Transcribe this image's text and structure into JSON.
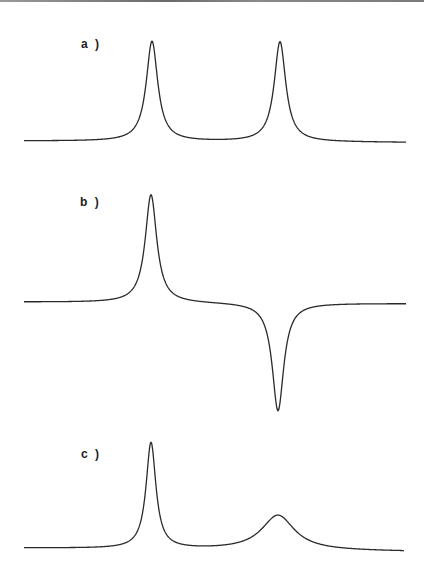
{
  "figure": {
    "panels": [
      {
        "label": "a )"
      },
      {
        "label": "b )"
      },
      {
        "label": "c )"
      }
    ]
  },
  "colors": {
    "line": "#2a2a2a",
    "background": "#ffffff"
  },
  "chart_data": [
    {
      "type": "line",
      "title": "a )",
      "description": "Two equal positive Lorentzian peaks",
      "xlabel": "",
      "ylabel": "",
      "grid": false,
      "series": [
        {
          "name": "spectrum",
          "peaks": [
            {
              "center": 152,
              "amplitude": 1.0,
              "width": 7
            },
            {
              "center": 280,
              "amplitude": 1.0,
              "width": 7
            }
          ]
        }
      ]
    },
    {
      "type": "line",
      "title": "b )",
      "description": "One positive peak and one equal negative (inverted) peak",
      "xlabel": "",
      "ylabel": "",
      "grid": false,
      "series": [
        {
          "name": "spectrum",
          "peaks": [
            {
              "center": 151,
              "amplitude": 1.0,
              "width": 7
            },
            {
              "center": 278,
              "amplitude": -1.0,
              "width": 7
            }
          ]
        }
      ]
    },
    {
      "type": "line",
      "title": "c )",
      "description": "One sharp peak and one broadened, reduced peak",
      "xlabel": "",
      "ylabel": "",
      "grid": false,
      "series": [
        {
          "name": "spectrum",
          "peaks": [
            {
              "center": 151,
              "amplitude": 1.0,
              "width": 6
            },
            {
              "center": 278,
              "amplitude": 0.33,
              "width": 20
            }
          ]
        }
      ]
    }
  ]
}
